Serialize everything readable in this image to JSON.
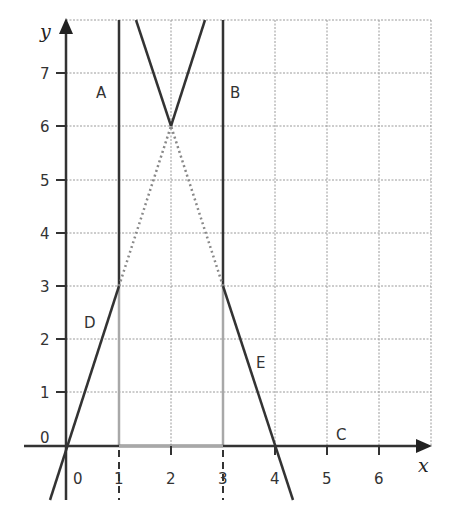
{
  "figure": {
    "axes": {
      "x_label": "x",
      "y_label": "y",
      "x_ticks": [
        "0",
        "1",
        "2",
        "3",
        "4",
        "5",
        "6"
      ],
      "y_ticks": [
        "0",
        "1",
        "2",
        "3",
        "4",
        "5",
        "6",
        "7"
      ],
      "x_range": [
        -0.3,
        7
      ],
      "y_range": [
        -1.3,
        8
      ]
    },
    "lines": [
      {
        "id": "A",
        "label": "A",
        "equation": "x = 1",
        "style": "solid"
      },
      {
        "id": "B",
        "label": "B",
        "equation": "x = 3",
        "style": "solid"
      },
      {
        "id": "C",
        "label": "C",
        "equation": "y = 0",
        "style": "solid"
      },
      {
        "id": "D",
        "label": "D",
        "equation": "y = 3x",
        "style": "solid below y=3, dotted above"
      },
      {
        "id": "E",
        "label": "E",
        "equation": "y = -3x + 12",
        "style": "solid below y=3, dotted above"
      }
    ],
    "intersection_point": {
      "x": 2,
      "y": 6
    },
    "colors": {
      "line": "#333333",
      "grid": "#999999",
      "region_edge": "#aaaaaa"
    }
  }
}
